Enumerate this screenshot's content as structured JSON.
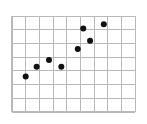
{
  "chart_data": {
    "type": "scatter",
    "title": "",
    "subtitle": "",
    "xlabel": "",
    "ylabel": "",
    "xlim": [
      0,
      9
    ],
    "ylim": [
      0,
      7
    ],
    "grid": true,
    "grid_color": "#b9b9b9",
    "grid_x_step": 1,
    "grid_y_step": 1,
    "x_tick_labels": [],
    "y_tick_labels": [],
    "legend": null,
    "legend_position": "none",
    "annotations": [],
    "series": [
      {
        "name": "points",
        "marker": "filled-circle",
        "marker_color": "#111111",
        "marker_size": 6,
        "x": [
          1.0,
          1.8,
          2.7,
          3.6,
          4.8,
          5.2,
          5.7,
          6.7
        ],
        "y": [
          2.6,
          3.3,
          3.8,
          3.3,
          4.6,
          6.1,
          5.2,
          6.4
        ]
      }
    ],
    "point_count": 8
  },
  "plot": {
    "background_color": "#ffffff",
    "grid_origin_px": [
      12,
      112
    ],
    "grid_cell_px": 13.7,
    "grid_cols": 9,
    "grid_rows": 7,
    "points_px": [
      [
        26,
        76
      ],
      [
        37,
        66
      ],
      [
        49,
        60
      ],
      [
        62,
        67
      ],
      [
        78,
        48
      ],
      [
        84,
        28
      ],
      [
        90,
        40
      ],
      [
        104,
        24
      ]
    ]
  }
}
